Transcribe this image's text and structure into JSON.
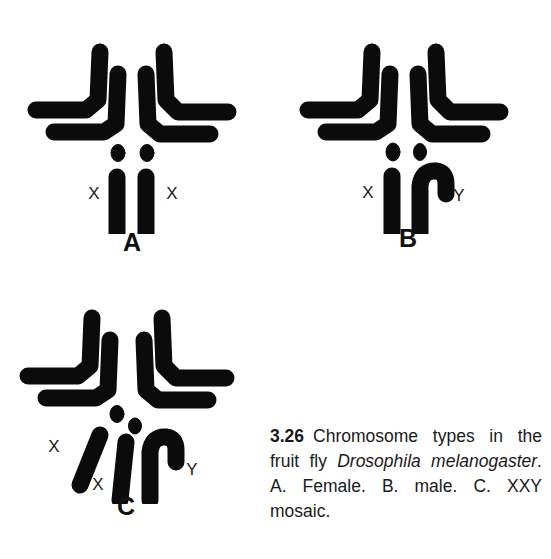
{
  "figure": {
    "number": "3.26",
    "caption_text": "Chromosome types in the fruit fly Drosophila melanogaster. A. Female. B. male. C. XXY mosaic.",
    "caption_part1": "Chromosome types in the fruit fly ",
    "caption_species": "Drosophila melanogaster",
    "caption_part2": ". A. Female. B. male. C. XXY mosaic.",
    "background_color": "#ffffff",
    "ink_color": "#0b0b0b"
  },
  "panels": [
    {
      "id": "A",
      "letter": "A",
      "description": "Female karyotype",
      "sex_chromosomes": [
        "X",
        "X"
      ],
      "labels": [
        {
          "text": "X",
          "name": "label-x-left"
        },
        {
          "text": "X",
          "name": "label-x-right"
        }
      ]
    },
    {
      "id": "B",
      "letter": "B",
      "description": "Male karyotype",
      "sex_chromosomes": [
        "X",
        "Y"
      ],
      "labels": [
        {
          "text": "X",
          "name": "label-x"
        },
        {
          "text": "Y",
          "name": "label-y"
        }
      ]
    },
    {
      "id": "C",
      "letter": "C",
      "description": "XXY mosaic karyotype",
      "sex_chromosomes": [
        "X",
        "X",
        "Y"
      ],
      "labels": [
        {
          "text": "X",
          "name": "label-x-outer"
        },
        {
          "text": "X",
          "name": "label-x-inner"
        },
        {
          "text": "Y",
          "name": "label-y"
        }
      ]
    }
  ],
  "chromosome_elements": {
    "autosome_v_left": "large V-shaped autosome pair, left cluster",
    "autosome_v_right": "large V-shaped autosome pair, right cluster",
    "dot_chromosome": "small dot chromosome (chromosome 4)",
    "rod_x": "straight rod X chromosome",
    "hooked_y": "J-hooked Y chromosome"
  }
}
